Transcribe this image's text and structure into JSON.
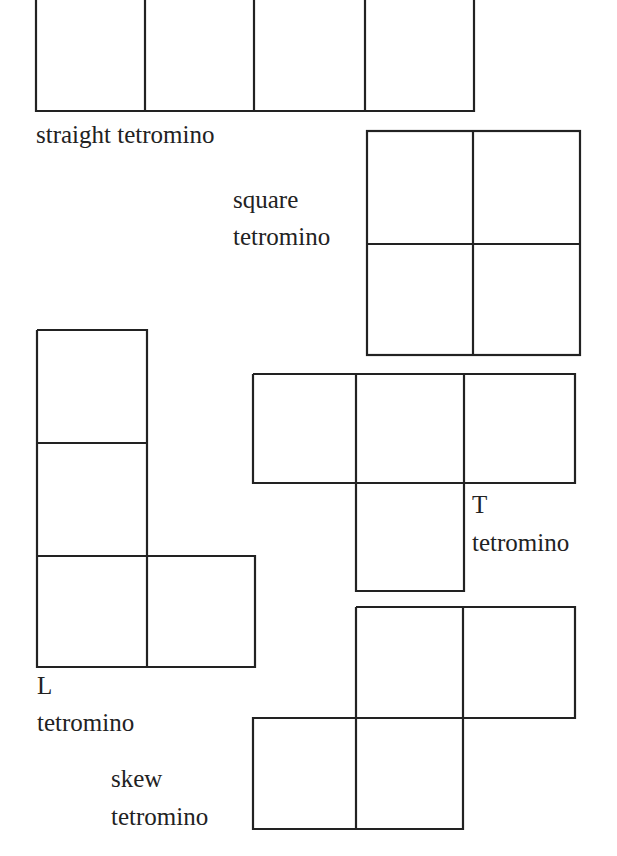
{
  "stroke_color": "#222222",
  "shapes": {
    "straight": {
      "label": "straight tetromino"
    },
    "square": {
      "label_line1": "square",
      "label_line2": "tetromino"
    },
    "L": {
      "label_line1": "L",
      "label_line2": "tetromino"
    },
    "T": {
      "label_line1": "T",
      "label_line2": "tetromino"
    },
    "skew": {
      "label_line1": "skew",
      "label_line2": "tetromino"
    }
  }
}
